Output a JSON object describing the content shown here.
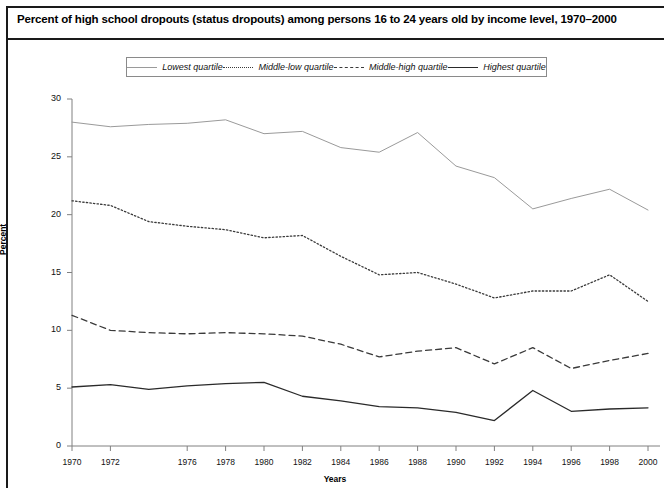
{
  "figure": {
    "title": "Percent of high school dropouts (status dropouts) among persons 16 to 24 years old by income level, 1970–2000"
  },
  "chart_data": {
    "type": "line",
    "title": "Percent of high school dropouts (status dropouts) among persons 16 to 24 years old by income level, 1970–2000",
    "xlabel": "Years",
    "ylabel": "Percent",
    "ylim": [
      0,
      30
    ],
    "xlim": [
      1970,
      2000
    ],
    "yticks": [
      0,
      5,
      10,
      15,
      20,
      25,
      30
    ],
    "xticks": [
      1970,
      1972,
      1976,
      1978,
      1980,
      1982,
      1984,
      1986,
      1988,
      1990,
      1992,
      1994,
      1996,
      1998,
      2000
    ],
    "grid": false,
    "legend_position": "top",
    "x": [
      1970,
      1972,
      1974,
      1976,
      1978,
      1980,
      1982,
      1984,
      1986,
      1988,
      1990,
      1992,
      1994,
      1996,
      1998,
      2000
    ],
    "series": [
      {
        "name": "Lowest quartile",
        "style": "solid",
        "color": "#9a9a9a",
        "width": 1.0,
        "values": [
          28.0,
          27.6,
          27.8,
          27.9,
          28.2,
          27.0,
          27.2,
          25.8,
          25.4,
          27.1,
          24.2,
          23.2,
          20.5,
          21.4,
          22.2,
          20.4
        ]
      },
      {
        "name": "Middle-low quartile",
        "style": "dotted",
        "color": "#3a3a3a",
        "width": 1.3,
        "values": [
          21.2,
          20.8,
          19.4,
          19.0,
          18.7,
          18.0,
          18.2,
          16.4,
          14.8,
          15.0,
          14.0,
          12.8,
          13.4,
          13.4,
          14.8,
          12.5
        ]
      },
      {
        "name": "Middle-high quartile",
        "style": "dashed",
        "color": "#3a3a3a",
        "width": 1.3,
        "values": [
          11.3,
          10.0,
          9.8,
          9.7,
          9.8,
          9.7,
          9.5,
          8.8,
          7.7,
          8.2,
          8.5,
          7.1,
          8.5,
          6.7,
          7.4,
          8.0
        ]
      },
      {
        "name": "Highest quartile",
        "style": "solid",
        "color": "#2a2a2a",
        "width": 1.3,
        "values": [
          5.1,
          5.3,
          4.9,
          5.2,
          5.4,
          5.5,
          4.3,
          3.9,
          3.4,
          3.3,
          2.9,
          2.2,
          4.8,
          3.0,
          3.2,
          3.3
        ]
      }
    ]
  },
  "legend": {
    "items": [
      {
        "label": "Lowest quartile",
        "style": "solid-light"
      },
      {
        "label": "Middle-low quartile",
        "style": "dotted"
      },
      {
        "label": "Middle-high quartile",
        "style": "dashed"
      },
      {
        "label": "Highest quartile",
        "style": "solid-dark"
      }
    ]
  }
}
